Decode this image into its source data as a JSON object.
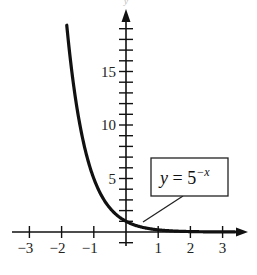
{
  "chart_data": {
    "type": "line",
    "title": "",
    "xlabel": "",
    "ylabel": "y",
    "function": "y = 5^(-x)",
    "annotation": {
      "variable": "y",
      "equals": " = 5",
      "exponent": "−x"
    },
    "x": [
      -1.84,
      -1.5,
      -1.25,
      -1.0,
      -0.75,
      -0.5,
      -0.25,
      0,
      0.25,
      0.5,
      0.75,
      1.0,
      1.5,
      2.0,
      2.5,
      3.0,
      3.3
    ],
    "values": [
      19.38,
      11.18,
      7.48,
      5.0,
      3.34,
      2.24,
      1.5,
      1.0,
      0.67,
      0.45,
      0.3,
      0.2,
      0.09,
      0.04,
      0.02,
      0.008,
      0.005
    ],
    "xlim": [
      -3.2,
      3.6
    ],
    "ylim": [
      -1.5,
      20
    ],
    "x_ticks": [
      -3,
      -2,
      -1,
      1,
      2,
      3
    ],
    "x_tick_labels": [
      "−3",
      "−2",
      "−1",
      "1",
      "2",
      "3"
    ],
    "y_ticks_minor_step": 1,
    "y_tick_labels": [
      {
        "value": 5,
        "label": "5"
      },
      {
        "value": 10,
        "label": "10"
      },
      {
        "value": 15,
        "label": "15"
      }
    ],
    "grid": false,
    "legend": "none"
  }
}
